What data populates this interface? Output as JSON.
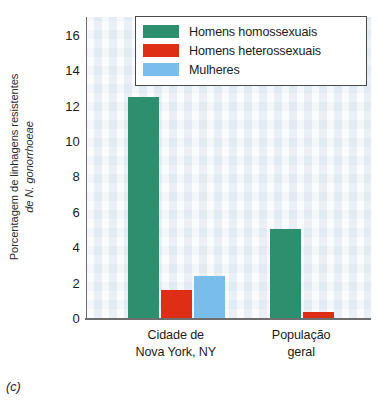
{
  "chart_data": {
    "type": "bar",
    "title": "",
    "xlabel": "",
    "ylabel_line1": "Porcentagem de linhagens resistentes",
    "ylabel_line2": "de N. gonorrhoeae",
    "ylabel_line2_italic_part": "N. gonorrhoeae",
    "ylim": [
      0,
      17
    ],
    "yticks": [
      0,
      2,
      4,
      6,
      8,
      10,
      12,
      14,
      16
    ],
    "ytick_labels": [
      "0",
      "2",
      "4",
      "6",
      "8",
      "10",
      "12",
      "14",
      "16"
    ],
    "grid": false,
    "categories": [
      "Cidade de Nova York, NY",
      "População geral"
    ],
    "category_labels": [
      {
        "line1": "Cidade de",
        "line2": "Nova York, NY"
      },
      {
        "line1": "População",
        "line2": "geral"
      }
    ],
    "legend_position": "top-right",
    "series": [
      {
        "name": "Homens homossexuais",
        "color": "#2e8f6f",
        "values": [
          12.5,
          5.0
        ]
      },
      {
        "name": "Homens heterossexuais",
        "color": "#de2e15",
        "values": [
          1.6,
          0.35
        ]
      },
      {
        "name": "Mulheres",
        "color": "#79bdec",
        "values": [
          2.35,
          0
        ]
      }
    ]
  },
  "legend": {
    "items": [
      {
        "label": "Homens homossexuais",
        "color": "#2e8f6f"
      },
      {
        "label": "Homens heterossexuais",
        "color": "#de2e15"
      },
      {
        "label": "Mulheres",
        "color": "#79bdec"
      }
    ]
  },
  "caption": "(c)",
  "colors": {
    "plot_background": "#edf2f7",
    "axis": "#6e6e6e",
    "text": "#1c1c1c",
    "green": "#2e8f6f",
    "red": "#de2e15",
    "blue": "#79bdec"
  }
}
